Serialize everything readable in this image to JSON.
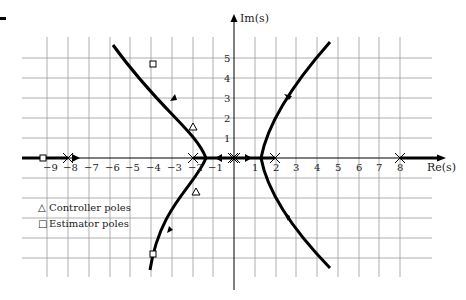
{
  "diagram": {
    "type": "root-locus",
    "axes": {
      "x_label": "Re(s)",
      "y_label": "Im(s)",
      "x_ticks": [
        "−9",
        "−8",
        "−7",
        "−6",
        "−5",
        "−4",
        "−3",
        "−2",
        "−1",
        "1",
        "2",
        "3",
        "4",
        "5",
        "6",
        "7",
        "8"
      ],
      "y_ticks": [
        "5",
        "4",
        "3",
        "2",
        "1"
      ]
    },
    "legend": {
      "controller_label": "Controller poles",
      "estimator_label": "Estimator poles",
      "controller_symbol": "△",
      "estimator_symbol": "□"
    },
    "open_loop_poles": [
      -8,
      -2,
      0,
      0,
      2,
      8
    ],
    "controller_poles": [
      [
        -2,
        1.5
      ],
      [
        -2,
        -1.5
      ]
    ],
    "estimator_poles": [
      [
        -9,
        0
      ],
      [
        -4,
        4.7
      ],
      [
        -4,
        -4.7
      ]
    ],
    "colors": {
      "locus": "#000000",
      "grid": "#9a9a9a",
      "axis": "#000000"
    }
  }
}
